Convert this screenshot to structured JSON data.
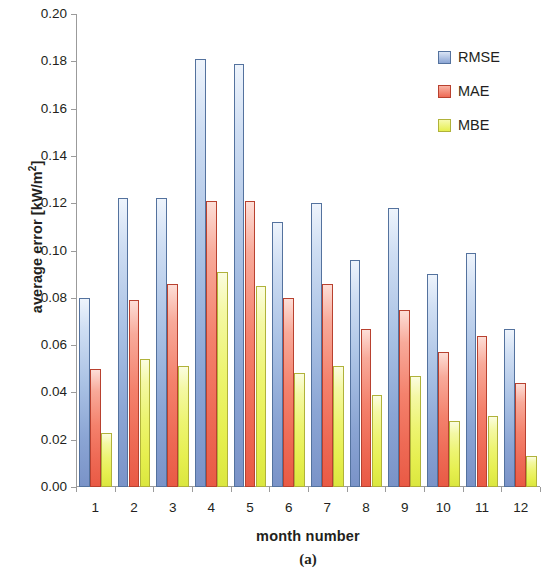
{
  "chart_data": {
    "type": "bar",
    "title": "",
    "subtitle": "",
    "caption": "(a)",
    "xlabel": "month number",
    "ylabel": "average error [kW/m²]",
    "ylabel_main": "average error [kW/m",
    "ylabel_sup": "2",
    "ylabel_tail": "]",
    "categories": [
      "1",
      "2",
      "3",
      "4",
      "5",
      "6",
      "7",
      "8",
      "9",
      "10",
      "11",
      "12"
    ],
    "series": [
      {
        "name": "RMSE",
        "color": "#8ba5d4",
        "values": [
          0.08,
          0.122,
          0.122,
          0.181,
          0.179,
          0.112,
          0.12,
          0.096,
          0.118,
          0.09,
          0.099,
          0.067
        ]
      },
      {
        "name": "MAE",
        "color": "#ee6a55",
        "values": [
          0.05,
          0.079,
          0.086,
          0.121,
          0.121,
          0.08,
          0.086,
          0.067,
          0.075,
          0.057,
          0.064,
          0.044
        ]
      },
      {
        "name": "MBE",
        "color": "#e6ef4f",
        "values": [
          0.023,
          0.054,
          0.051,
          0.091,
          0.085,
          0.048,
          0.051,
          0.039,
          0.047,
          0.028,
          0.03,
          0.013
        ]
      }
    ],
    "ylim": [
      0.0,
      0.2
    ],
    "ytick_values": [
      0.0,
      0.02,
      0.04,
      0.06,
      0.08,
      0.1,
      0.12,
      0.14,
      0.16,
      0.18,
      0.2
    ],
    "ytick_labels": [
      "0.00",
      "0.02",
      "0.04",
      "0.06",
      "0.08",
      "0.10",
      "0.12",
      "0.14",
      "0.16",
      "0.18",
      "0.20"
    ],
    "grid": false,
    "legend_position": "top-right",
    "legend_entries": [
      "RMSE",
      "MAE",
      "MBE"
    ]
  }
}
